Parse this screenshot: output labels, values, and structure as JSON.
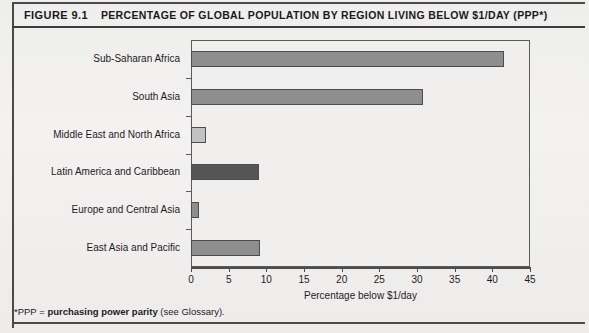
{
  "figure": {
    "number": "FIGURE 9.1",
    "title": "PERCENTAGE OF GLOBAL POPULATION BY REGION LIVING BELOW $1/DAY (PPP*)",
    "footnote_marker": "*PPP = ",
    "footnote_bold": "purchasing power parity",
    "footnote_tail": " (see Glossary)."
  },
  "chart_data": {
    "type": "bar",
    "orientation": "horizontal",
    "title": "PERCENTAGE OF GLOBAL POPULATION BY REGION LIVING BELOW $1/DAY (PPP*)",
    "xlabel": "Percentage below $1/day",
    "ylabel": "",
    "xlim": [
      0,
      45
    ],
    "xticks": [
      0,
      5,
      10,
      15,
      20,
      25,
      30,
      35,
      40,
      45
    ],
    "xtick_labels": [
      "0",
      "5",
      "10",
      "15",
      "20",
      "25",
      "30",
      "35",
      "40",
      "45"
    ],
    "grid": false,
    "legend": null,
    "categories": [
      "Sub-Saharan Africa",
      "South Asia",
      "Middle East and North Africa",
      "Latin America and Caribbean",
      "Europe and Central Asia",
      "East Asia and Pacific"
    ],
    "values": [
      41.5,
      30.8,
      2.0,
      9.0,
      1.0,
      9.2
    ],
    "bar_colors": [
      "#8e8e8e",
      "#8e8e8e",
      "#c2c2c2",
      "#555555",
      "#8e8e8e",
      "#8e8e8e"
    ],
    "bar_edge_color": "#4d4d4d"
  },
  "colors": {
    "frame": "#5b5b5b",
    "rule": "#4a4a4a",
    "text": "#1c1c1c",
    "plot_background": "#f0efed",
    "page_background": "#eeeeec"
  }
}
